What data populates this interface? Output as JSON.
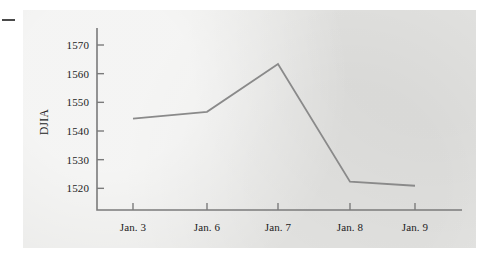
{
  "figure": {
    "background_color": "#e8e8e6",
    "axis_color": "#7b7b7b",
    "line_color": "#8a8a8a",
    "text_color": "#1c1c1c"
  },
  "chart_data": {
    "type": "line",
    "title": "",
    "subtitle": "",
    "xlabel": "",
    "ylabel": "DJIA",
    "categories": [
      "Jan. 3",
      "Jan. 6",
      "Jan. 7",
      "Jan. 8",
      "Jan. 9"
    ],
    "values": [
      1544.3,
      1546.7,
      1563.4,
      1522.3,
      1520.9
    ],
    "series": [
      {
        "name": "DJIA",
        "values": [
          1544.3,
          1546.7,
          1563.4,
          1522.3,
          1520.9
        ]
      }
    ],
    "ylim": [
      1512,
      1574
    ],
    "yticks": [
      1520,
      1530,
      1540,
      1550,
      1560,
      1570
    ],
    "ytick_labels": [
      "1520",
      "1530",
      "1540",
      "1550",
      "1560",
      "1570"
    ],
    "xtick_labels": [
      "Jan. 3",
      "Jan. 6",
      "Jan. 7",
      "Jan. 8",
      "Jan. 9"
    ],
    "grid": false,
    "legend": false,
    "legend_position": "none",
    "markers": false,
    "annotations": []
  }
}
